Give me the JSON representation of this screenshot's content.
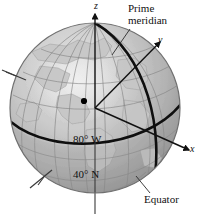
{
  "figure": {
    "background_color": "#ffffff",
    "sphere": {
      "center_x": 95,
      "center_y": 108,
      "radius": 85,
      "fill_light": "#d8d8d8",
      "fill_mid": "#b0b0b0",
      "fill_dark": "#8e8e8e",
      "outline_color": "#6a6a6a"
    },
    "graticule_color": "#8a8a8a",
    "landmass_color": "#c9c9c9",
    "heavy_line_color": "#101010"
  },
  "labels": {
    "prime_meridian": "Prime\nmeridian",
    "equator": "Equator",
    "coordinates_line1": "80° W",
    "coordinates_line2": "40° N",
    "axis_z": "z",
    "axis_y": "y",
    "axis_x": "x"
  },
  "point_marker": {
    "name": "location-point",
    "x": 84,
    "y": 101,
    "radius": 3,
    "color": "#000000",
    "longitude": "80° W",
    "latitude": "40° N"
  },
  "axes": [
    {
      "name": "z-axis",
      "label": "z",
      "direction": "up",
      "arrow": true
    },
    {
      "name": "y-axis",
      "label": "y",
      "direction": "upper-right",
      "arrow": true
    },
    {
      "name": "x-axis",
      "label": "x",
      "direction": "lower-right",
      "arrow": true
    }
  ],
  "leader_lines": [
    {
      "name": "prime-meridian-leader",
      "from_label": "Prime meridian",
      "to": "prime meridian arc"
    },
    {
      "name": "equator-leader",
      "from_label": "Equator",
      "to": "equator arc"
    }
  ]
}
